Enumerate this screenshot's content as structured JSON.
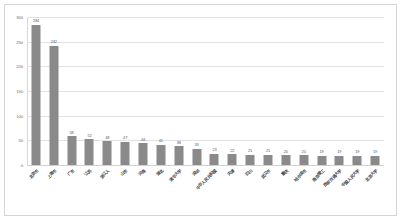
{
  "chart_data": {
    "type": "bar",
    "title": "",
    "subtitle": "",
    "xlabel": "",
    "ylabel": "",
    "ylim": [
      0,
      300
    ],
    "yticks": [
      0,
      50,
      100,
      150,
      200,
      250,
      300
    ],
    "grid": true,
    "legend": false,
    "orientation": "vertical",
    "bar_color": "#8a8a8a",
    "categories": [
      "北京市",
      "上海市",
      "广东",
      "江苏",
      "浙江人",
      "山东",
      "河南",
      "湖北",
      "清华大学",
      "深圳",
      "中华人民共和国",
      "天津",
      "四川",
      "武汉市",
      "重庆",
      "哈尔滨市",
      "南京理工",
      "西安交通大学",
      "中国人民大学",
      "北京大学"
    ],
    "values": [
      284,
      242,
      58,
      52,
      48,
      47,
      44,
      41,
      38,
      33,
      23,
      22,
      21,
      21,
      20,
      20,
      19,
      19,
      19,
      19
    ],
    "value_labels": [
      "284",
      "242",
      "58",
      "52",
      "48",
      "47",
      "44",
      "41",
      "38",
      "33",
      "23",
      "22",
      "21",
      "21",
      "20",
      "20",
      "19",
      "19",
      "19",
      "19"
    ],
    "ytick_labels": [
      "0",
      "50",
      "100",
      "150",
      "200",
      "250",
      "300"
    ]
  }
}
